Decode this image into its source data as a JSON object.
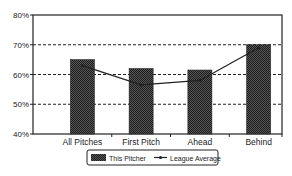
{
  "chart_data": {
    "type": "bar",
    "title": "",
    "xlabel": "",
    "ylabel": "",
    "categories": [
      "All Pitches",
      "First Pitch",
      "Ahead",
      "Behind"
    ],
    "series": [
      {
        "name": "This Pitcher",
        "type": "bar",
        "values": [
          65,
          62,
          61.5,
          70
        ],
        "color": "#3a3a3a"
      },
      {
        "name": "League Average",
        "type": "line",
        "values": [
          63,
          56.5,
          58,
          69
        ],
        "color": "#222222"
      }
    ],
    "ylim": [
      40,
      80
    ],
    "yticks": [
      "40%",
      "50%",
      "60%",
      "70%",
      "80%"
    ],
    "ytick_values": [
      40,
      50,
      60,
      70,
      80
    ],
    "grid": {
      "y": true,
      "style": "dashed"
    },
    "legend": {
      "position": "bottom",
      "entries": [
        "This Pitcher",
        "League Average"
      ]
    }
  },
  "legend": {
    "bar_label": "This Pitcher",
    "line_label": "League Average"
  }
}
